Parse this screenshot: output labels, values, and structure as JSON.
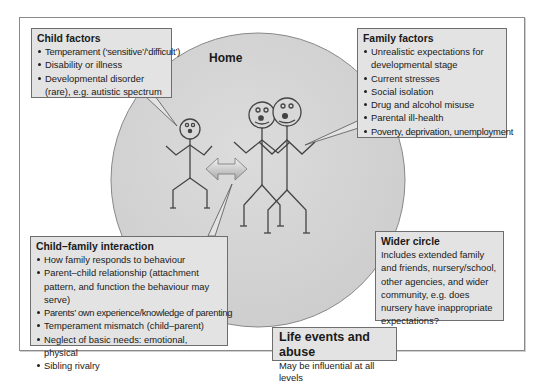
{
  "diagram": {
    "circle_label": "Home",
    "colors": {
      "circle_fill": "#d6d6d6",
      "box_fill": "#e3e3e3",
      "box_border": "#6e6e6e",
      "frame_border": "#8a8a8a"
    },
    "figures": [
      "child-stick-figure",
      "parent-stick-figure-1",
      "parent-stick-figure-2",
      "double-arrow"
    ]
  },
  "child_factors": {
    "title": "Child factors",
    "items": [
      "Temperament (‘sensitive’/‘difficult’)",
      "Disability or illness",
      "Developmental disorder (rare), e.g. autistic spectrum"
    ]
  },
  "family_factors": {
    "title": "Family factors",
    "items": [
      "Unrealistic expectations for developmental stage",
      "Current stresses",
      "Social isolation",
      "Drug and alcohol misuse",
      "Parental ill-health",
      "Poverty, deprivation, unemployment"
    ]
  },
  "child_family_interaction": {
    "title": "Child–family interaction",
    "items": [
      "How family responds to behaviour",
      "Parent–child relationship (attachment pattern, and function the behaviour may serve)",
      "Parents’ own experience/knowledge of parenting",
      "Temperament mismatch (child–parent)",
      "Neglect of basic needs: emotional, physical",
      "Sibling rivalry"
    ]
  },
  "wider_circle": {
    "title": "Wider circle",
    "text": "Includes extended family and friends, nursery/school, other agencies, and wider community, e.g. does nursery have inappropriate expectations?"
  },
  "life_events": {
    "title": "Life events and abuse",
    "text": "May be influential at all levels"
  }
}
